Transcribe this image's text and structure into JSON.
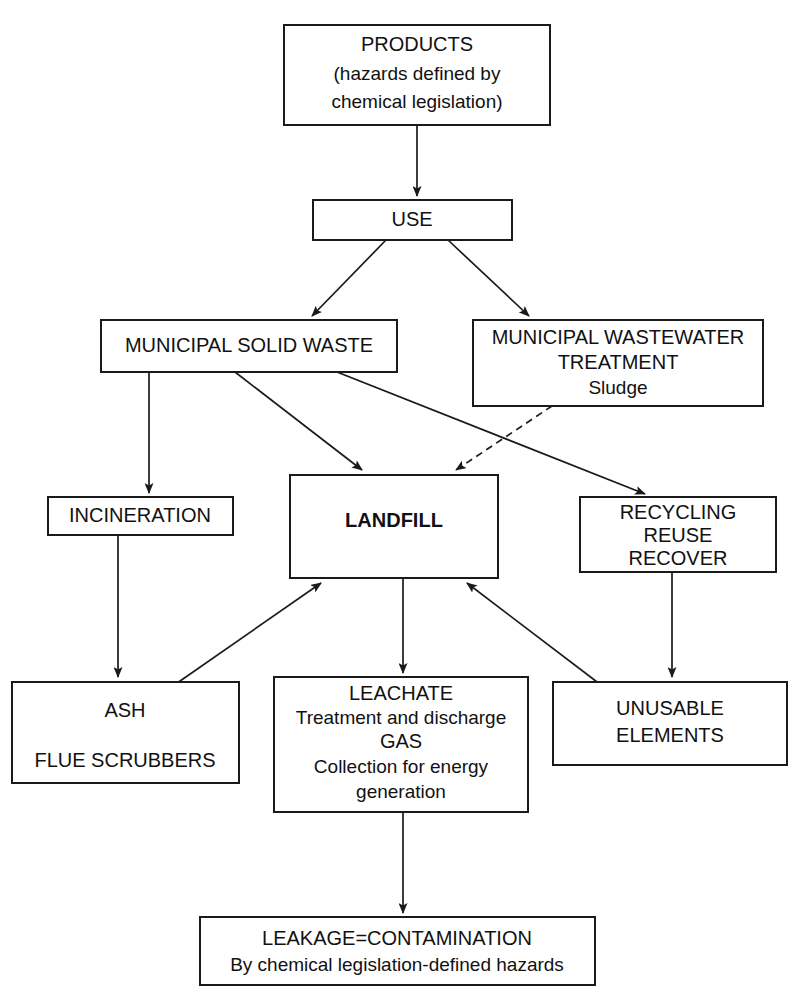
{
  "diagram": {
    "background_color": "#ffffff",
    "line_color": "#1a1a1a",
    "box_fill": "#ffffff",
    "nodes": {
      "products": {
        "id": "products",
        "lines": [
          "PRODUCTS",
          "(hazards defined by",
          "chemical legislation)"
        ],
        "line1": "PRODUCTS",
        "line2": "(hazards defined by",
        "line3": "chemical legislation)"
      },
      "use": {
        "id": "use",
        "line1": "USE"
      },
      "msw": {
        "id": "municipal-solid-waste",
        "line1": "MUNICIPAL SOLID WASTE"
      },
      "mwt": {
        "id": "municipal-wastewater-treatment",
        "line1": "MUNICIPAL WASTEWATER",
        "line2": "TREATMENT",
        "line3": "Sludge"
      },
      "incineration": {
        "id": "incineration",
        "line1": "INCINERATION"
      },
      "landfill": {
        "id": "landfill",
        "line1": "LANDFILL",
        "emphasis": "bold"
      },
      "recycling": {
        "id": "recycling-reuse-recover",
        "line1": "RECYCLING",
        "line2": "REUSE",
        "line3": "RECOVER"
      },
      "ash": {
        "id": "ash-flue-scrubbers",
        "line1": "ASH",
        "line2": "FLUE SCRUBBERS"
      },
      "leachate": {
        "id": "leachate-gas",
        "line1": "LEACHATE",
        "line2": "Treatment and discharge",
        "line3": "GAS",
        "line4": "Collection for energy",
        "line5": "generation"
      },
      "unusable": {
        "id": "unusable-elements",
        "line1": "UNUSABLE",
        "line2": "ELEMENTS"
      },
      "leakage": {
        "id": "leakage-contamination",
        "line1": "LEAKAGE=CONTAMINATION",
        "line2": "By chemical legislation-defined hazards"
      }
    },
    "edges": [
      {
        "id": "products-to-use",
        "from": "products",
        "to": "use",
        "style": "solid",
        "arrow": true
      },
      {
        "id": "use-to-msw",
        "from": "use",
        "to": "msw",
        "style": "solid",
        "arrow": true
      },
      {
        "id": "use-to-mwt",
        "from": "use",
        "to": "mwt",
        "style": "solid",
        "arrow": true
      },
      {
        "id": "msw-to-incineration",
        "from": "msw",
        "to": "incineration",
        "style": "solid",
        "arrow": true
      },
      {
        "id": "msw-to-landfill",
        "from": "msw",
        "to": "landfill",
        "style": "solid",
        "arrow": true
      },
      {
        "id": "msw-to-recycling",
        "from": "msw",
        "to": "recycling",
        "style": "solid",
        "arrow": true
      },
      {
        "id": "mwt-to-landfill",
        "from": "mwt",
        "to": "landfill",
        "style": "dashed",
        "arrow": true
      },
      {
        "id": "incineration-to-ash",
        "from": "incineration",
        "to": "ash",
        "style": "solid",
        "arrow": true
      },
      {
        "id": "ash-to-landfill",
        "from": "ash",
        "to": "landfill",
        "style": "solid",
        "arrow": true
      },
      {
        "id": "landfill-to-leachate",
        "from": "landfill",
        "to": "leachate",
        "style": "solid",
        "arrow": true
      },
      {
        "id": "recycling-to-unusable",
        "from": "recycling",
        "to": "unusable",
        "style": "solid",
        "arrow": true
      },
      {
        "id": "unusable-to-landfill",
        "from": "unusable",
        "to": "landfill",
        "style": "solid",
        "arrow": true
      },
      {
        "id": "leachate-to-leakage",
        "from": "leachate",
        "to": "leakage",
        "style": "solid",
        "arrow": true
      }
    ]
  }
}
